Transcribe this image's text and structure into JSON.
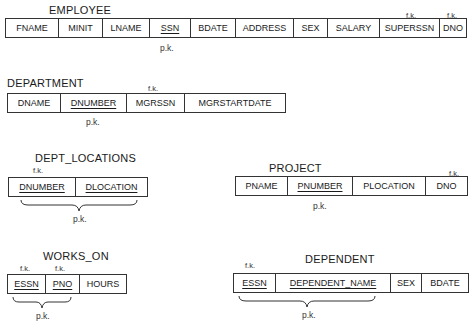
{
  "diagram_title": "Relational schema with primary and foreign keys",
  "labels": {
    "pk": "p.k.",
    "fk": "f.k."
  },
  "relations": {
    "employee": {
      "name": "EMPLOYEE",
      "attributes": [
        {
          "name": "FNAME"
        },
        {
          "name": "MINIT"
        },
        {
          "name": "LNAME"
        },
        {
          "name": "SSN",
          "pk": true
        },
        {
          "name": "BDATE"
        },
        {
          "name": "ADDRESS"
        },
        {
          "name": "SEX"
        },
        {
          "name": "SALARY"
        },
        {
          "name": "SUPERSSN",
          "fk": true
        },
        {
          "name": "DNO",
          "fk": true
        }
      ]
    },
    "department": {
      "name": "DEPARTMENT",
      "attributes": [
        {
          "name": "DNAME"
        },
        {
          "name": "DNUMBER",
          "pk": true
        },
        {
          "name": "MGRSSN",
          "fk": true
        },
        {
          "name": "MGRSTARTDATE"
        }
      ]
    },
    "dept_locations": {
      "name": "DEPT_LOCATIONS",
      "attributes": [
        {
          "name": "DNUMBER",
          "pk": true,
          "fk": true
        },
        {
          "name": "DLOCATION",
          "pk": true
        }
      ]
    },
    "project": {
      "name": "PROJECT",
      "attributes": [
        {
          "name": "PNAME"
        },
        {
          "name": "PNUMBER",
          "pk": true
        },
        {
          "name": "PLOCATION"
        },
        {
          "name": "DNO",
          "fk": true
        }
      ]
    },
    "works_on": {
      "name": "WORKS_ON",
      "attributes": [
        {
          "name": "ESSN",
          "pk": true,
          "fk": true
        },
        {
          "name": "PNO",
          "pk": true,
          "fk": true
        },
        {
          "name": "HOURS"
        }
      ]
    },
    "dependent": {
      "name": "DEPENDENT",
      "attributes": [
        {
          "name": "ESSN",
          "pk": true,
          "fk": true
        },
        {
          "name": "DEPENDENT_NAME",
          "pk": true
        },
        {
          "name": "SEX"
        },
        {
          "name": "BDATE"
        }
      ]
    }
  }
}
